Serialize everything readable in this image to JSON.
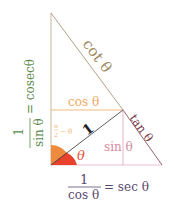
{
  "diagram": {
    "labels": {
      "cot": "cot θ",
      "cos": "cos θ",
      "tan": "tan θ",
      "sin": "sin θ",
      "radius": "1",
      "theta": "θ",
      "complement_num": "π",
      "complement_den": "2",
      "complement_rest": "− θ",
      "cosec_num": "1",
      "cosec_den": "sin θ",
      "cosec_eq": "= cosecθ",
      "sec_num": "1",
      "sec_den": "cos θ",
      "sec_eq": "= sec θ"
    },
    "colors": {
      "outline": "#b7a58a",
      "cot": "#a08a64",
      "cos": "#f0a860",
      "tan": "#7a3c48",
      "sin": "#d88aa4",
      "radius": "#333333",
      "theta_wedge": "#e8412c",
      "complement_wedge": "#f08a3c",
      "cosec_text": "#5a8a4a",
      "sec_text": "#5a4a70",
      "theta_text": "#e8503a",
      "complement_text": "#f0b070"
    }
  }
}
